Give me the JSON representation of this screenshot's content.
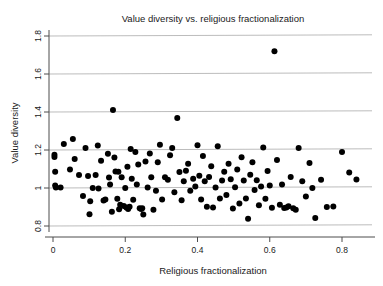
{
  "chart_data": {
    "type": "scatter",
    "title": "Value diversity vs. religious fractionalization",
    "xlabel": "Religious fractionalization",
    "ylabel": "Value diversity",
    "xlim": [
      -0.035,
      0.9
    ],
    "ylim": [
      0.78,
      1.82
    ],
    "xticks": [
      0,
      0.2,
      0.4,
      0.6,
      0.8
    ],
    "xticklabels": [
      "0",
      "0.2",
      "0.4",
      "0.6",
      "0.8"
    ],
    "yticks": [
      0.8,
      1.0,
      1.2,
      1.4,
      1.6,
      1.8
    ],
    "yticklabels": [
      "0.8",
      "1",
      "1.2",
      "1.4",
      "1.6",
      "1.8"
    ],
    "grid": "horizontal",
    "gridlines_y": [
      0.8,
      1.0,
      1.2,
      1.4,
      1.6,
      1.8
    ],
    "legend": null,
    "marker": "filled-circle",
    "marker_color": "#000000",
    "marker_size": 4.2,
    "n_points": 128,
    "points": [
      [
        0.004,
        1.175
      ],
      [
        0.004,
        1.163
      ],
      [
        0.006,
        1.085
      ],
      [
        0.006,
        1.013
      ],
      [
        0.008,
        1.003
      ],
      [
        0.021,
        1.002
      ],
      [
        0.03,
        1.232
      ],
      [
        0.047,
        1.097
      ],
      [
        0.055,
        1.258
      ],
      [
        0.06,
        1.152
      ],
      [
        0.072,
        1.068
      ],
      [
        0.083,
        0.958
      ],
      [
        0.09,
        1.21
      ],
      [
        0.097,
        1.063
      ],
      [
        0.101,
        0.862
      ],
      [
        0.103,
        0.93
      ],
      [
        0.11,
        1.0
      ],
      [
        0.118,
        1.068
      ],
      [
        0.124,
        1.224
      ],
      [
        0.126,
        0.998
      ],
      [
        0.133,
        1.143
      ],
      [
        0.14,
        0.934
      ],
      [
        0.145,
        0.94
      ],
      [
        0.152,
        1.18
      ],
      [
        0.155,
        1.055
      ],
      [
        0.158,
        1.018
      ],
      [
        0.163,
        0.875
      ],
      [
        0.166,
        1.41
      ],
      [
        0.17,
        1.16
      ],
      [
        0.173,
        1.087
      ],
      [
        0.178,
        0.944
      ],
      [
        0.181,
        1.085
      ],
      [
        0.183,
        0.888
      ],
      [
        0.186,
        0.912
      ],
      [
        0.19,
        1.056
      ],
      [
        0.196,
        0.905
      ],
      [
        0.2,
        1.0
      ],
      [
        0.203,
        0.898
      ],
      [
        0.206,
        1.112
      ],
      [
        0.208,
        0.89
      ],
      [
        0.212,
        0.901
      ],
      [
        0.215,
        1.205
      ],
      [
        0.218,
        1.049
      ],
      [
        0.222,
        0.938
      ],
      [
        0.228,
        1.19
      ],
      [
        0.232,
        1.018
      ],
      [
        0.236,
        1.124
      ],
      [
        0.24,
        0.893
      ],
      [
        0.244,
        0.889
      ],
      [
        0.247,
        0.893
      ],
      [
        0.25,
        0.86
      ],
      [
        0.256,
        1.139
      ],
      [
        0.262,
        1.003
      ],
      [
        0.268,
        1.182
      ],
      [
        0.272,
        1.057
      ],
      [
        0.278,
        0.886
      ],
      [
        0.285,
        0.985
      ],
      [
        0.29,
        1.136
      ],
      [
        0.296,
        1.228
      ],
      [
        0.302,
        0.94
      ],
      [
        0.31,
        1.057
      ],
      [
        0.318,
        1.043
      ],
      [
        0.324,
        1.172
      ],
      [
        0.33,
        1.21
      ],
      [
        0.336,
        0.978
      ],
      [
        0.344,
        1.368
      ],
      [
        0.35,
        1.084
      ],
      [
        0.356,
        0.935
      ],
      [
        0.362,
        1.036
      ],
      [
        0.368,
        1.091
      ],
      [
        0.374,
        1.128
      ],
      [
        0.38,
        0.986
      ],
      [
        0.388,
        1.049
      ],
      [
        0.394,
        1.008
      ],
      [
        0.4,
        1.225
      ],
      [
        0.405,
        1.064
      ],
      [
        0.41,
        0.94
      ],
      [
        0.415,
        1.168
      ],
      [
        0.42,
        1.035
      ],
      [
        0.426,
        0.901
      ],
      [
        0.432,
        1.058
      ],
      [
        0.438,
        1.114
      ],
      [
        0.443,
        0.897
      ],
      [
        0.45,
        1.003
      ],
      [
        0.456,
        1.22
      ],
      [
        0.462,
        0.945
      ],
      [
        0.468,
        1.04
      ],
      [
        0.474,
        1.085
      ],
      [
        0.48,
        0.963
      ],
      [
        0.486,
        1.127
      ],
      [
        0.492,
        1.046
      ],
      [
        0.498,
        0.892
      ],
      [
        0.504,
        1.004
      ],
      [
        0.51,
        1.098
      ],
      [
        0.516,
        0.918
      ],
      [
        0.522,
        1.162
      ],
      [
        0.528,
        1.04
      ],
      [
        0.534,
        0.945
      ],
      [
        0.54,
        0.838
      ],
      [
        0.546,
        1.07
      ],
      [
        0.552,
        1.135
      ],
      [
        0.558,
        0.99
      ],
      [
        0.564,
        1.041
      ],
      [
        0.57,
        0.909
      ],
      [
        0.576,
        1.008
      ],
      [
        0.582,
        1.213
      ],
      [
        0.588,
        0.944
      ],
      [
        0.594,
        1.09
      ],
      [
        0.6,
        1.013
      ],
      [
        0.606,
        0.896
      ],
      [
        0.613,
        1.72
      ],
      [
        0.62,
        1.148
      ],
      [
        0.628,
        0.912
      ],
      [
        0.634,
        1.018
      ],
      [
        0.64,
        0.895
      ],
      [
        0.646,
        0.898
      ],
      [
        0.652,
        0.904
      ],
      [
        0.658,
        1.058
      ],
      [
        0.665,
        0.894
      ],
      [
        0.672,
        0.886
      ],
      [
        0.68,
        1.21
      ],
      [
        0.69,
        1.036
      ],
      [
        0.7,
        0.955
      ],
      [
        0.71,
        1.132
      ],
      [
        0.718,
        1.0
      ],
      [
        0.726,
        0.842
      ],
      [
        0.742,
        1.044
      ],
      [
        0.758,
        0.9
      ],
      [
        0.776,
        0.902
      ],
      [
        0.8,
        1.19
      ],
      [
        0.82,
        1.082
      ],
      [
        0.84,
        1.045
      ]
    ]
  }
}
